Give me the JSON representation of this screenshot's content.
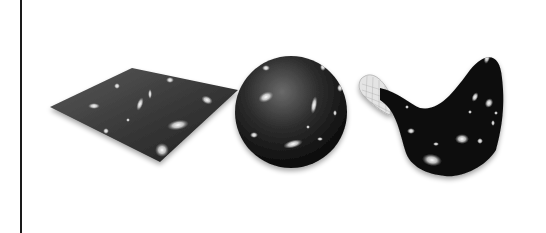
{
  "figure": {
    "shapes": [
      {
        "id": "flat",
        "name": "flat-plane-geometry"
      },
      {
        "id": "closed",
        "name": "spherical-closed-geometry"
      },
      {
        "id": "open",
        "name": "saddle-open-geometry"
      }
    ],
    "colors": {
      "background": "#ffffff",
      "border_line": "#1a1a1a",
      "surface_dark": "#0c0c0c",
      "surface_mid": "#3a3a3a",
      "galaxy_glow": "#f2f2f2",
      "grid": "#bdbdbd"
    }
  }
}
